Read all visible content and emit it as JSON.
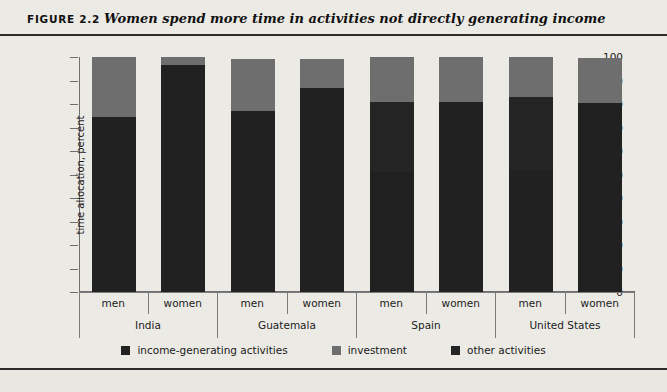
{
  "figure": {
    "number_label": "FIGURE 2.2",
    "title": "Women spend more time in activities not directly generating income"
  },
  "colors": {
    "income_generating": "#222122",
    "investment": "#6e6e6e",
    "other_activities": "#262526",
    "page_background": "#eceae5",
    "axis": "#6f6f6f"
  },
  "legend": {
    "items": [
      {
        "label": "income-generating activities",
        "swatch": "#222122"
      },
      {
        "label": "investment",
        "swatch": "#6e6e6e"
      },
      {
        "label": "other activities",
        "swatch": "#262526"
      }
    ]
  },
  "chart_data": {
    "type": "bar",
    "title": "Women spend more time in activities not directly generating income",
    "xlabel": "",
    "ylabel": "time allocation, percent",
    "ylim": [
      0,
      100
    ],
    "yticks": [
      0,
      10,
      20,
      30,
      40,
      50,
      60,
      70,
      80,
      90,
      100
    ],
    "grid": false,
    "stacked": true,
    "legend_position": "bottom",
    "groups": [
      "India",
      "Guatemala",
      "Spain",
      "United States"
    ],
    "subcategories": [
      "men",
      "women"
    ],
    "categories": [
      "India men",
      "India women",
      "Guatemala men",
      "Guatemala women",
      "Spain men",
      "Spain women",
      "United States men",
      "United States women"
    ],
    "series": [
      {
        "name": "income-generating activities",
        "values": [
          74.5,
          96.5,
          77.0,
          87.0,
          51.0,
          81.0,
          52.0,
          80.5
        ]
      },
      {
        "name": "other activities",
        "values": [
          0,
          0,
          0,
          0,
          30.0,
          0,
          31.0,
          0
        ]
      },
      {
        "name": "investment",
        "values": [
          25.5,
          3.5,
          22.0,
          12.0,
          19.0,
          19.0,
          17.0,
          19.0
        ]
      }
    ],
    "bars": [
      {
        "group": "India",
        "sub": "men",
        "income_generating": 74.5,
        "other_activities": 0,
        "investment": 25.5,
        "total": 100.0
      },
      {
        "group": "India",
        "sub": "women",
        "income_generating": 96.5,
        "other_activities": 0,
        "investment": 3.5,
        "total": 100.0
      },
      {
        "group": "Guatemala",
        "sub": "men",
        "income_generating": 77.0,
        "other_activities": 0,
        "investment": 22.0,
        "total": 99.0
      },
      {
        "group": "Guatemala",
        "sub": "women",
        "income_generating": 87.0,
        "other_activities": 0,
        "investment": 12.0,
        "total": 99.0
      },
      {
        "group": "Spain",
        "sub": "men",
        "income_generating": 51.0,
        "other_activities": 30.0,
        "investment": 19.0,
        "total": 100.0
      },
      {
        "group": "Spain",
        "sub": "women",
        "income_generating": 81.0,
        "other_activities": 0,
        "investment": 19.0,
        "total": 100.0
      },
      {
        "group": "United States",
        "sub": "men",
        "income_generating": 52.0,
        "other_activities": 31.0,
        "investment": 17.0,
        "total": 100.0
      },
      {
        "group": "United States",
        "sub": "women",
        "income_generating": 80.5,
        "other_activities": 0,
        "investment": 19.0,
        "total": 99.5
      }
    ]
  }
}
